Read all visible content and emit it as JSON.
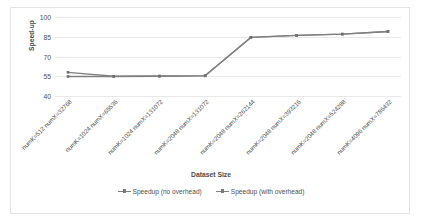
{
  "chart_data": {
    "type": "line",
    "title": "",
    "xlabel": "Dataset Size",
    "ylabel": "Speed-up",
    "ylim": [
      40,
      100
    ],
    "yticks": [
      40,
      55,
      70,
      85,
      100
    ],
    "grid": true,
    "legend_position": "bottom",
    "categories": [
      "numK=512 numX=32768",
      "numK=1024 numX=65536",
      "numK=1024 numX=131072",
      "numK=2048 numX=131072",
      "numK=2048 numX=262144",
      "numK=2048 numX=393216",
      "numK=2048 numX=524288",
      "numK=4096 numX=786432"
    ],
    "series": [
      {
        "name": "Speedup (no overhead)",
        "color": "#808080",
        "values": [
          58.0,
          55.0,
          55.2,
          55.5,
          84.5,
          86.0,
          87.0,
          89.0
        ]
      },
      {
        "name": "Speedup (with overhead)",
        "color": "#808080",
        "values": [
          54.8,
          54.8,
          55.0,
          55.3,
          84.5,
          86.0,
          87.0,
          89.0
        ]
      }
    ]
  },
  "axes": {
    "y_title": "Speed-up",
    "x_title": "Dataset Size",
    "y_tick_labels": [
      "40",
      "55",
      "70",
      "85",
      "100"
    ]
  },
  "legend": {
    "items": [
      {
        "label": "Speedup (no overhead)"
      },
      {
        "label": "Speedup (with overhead)"
      }
    ]
  }
}
